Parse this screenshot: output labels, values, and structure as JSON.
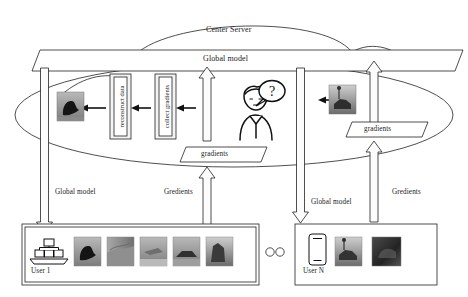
{
  "diagram": {
    "title_cloud": "Center Server",
    "global_model_banner": "Global model",
    "server_blocks": [
      {
        "label": "reconstruct data"
      },
      {
        "label": "collect gradients"
      }
    ],
    "attacker_icon": "person-with-question-icon",
    "gradient_tags": [
      {
        "label": "gradients"
      },
      {
        "label": "gradients"
      }
    ],
    "channel_labels": [
      {
        "label": "Global model"
      },
      {
        "label": "Gredients"
      },
      {
        "label": "Global model"
      },
      {
        "label": "Gredients"
      }
    ],
    "users": [
      {
        "name": "User 1",
        "device_icon": "server-rack-icon",
        "thumbnails": [
          "image-bird-dark",
          "image-landscape-gray",
          "image-plane-sky",
          "image-truck-road",
          "image-horse-field"
        ]
      },
      {
        "name": "User N",
        "device_icon": "smartphone-icon",
        "thumbnails": [
          "image-horse-rider",
          "image-dark-scene"
        ]
      }
    ],
    "ellipsis": "○○",
    "reconstructed_image": "image-bird-dark-reconstructed",
    "leaked_image": "image-horse-rider-leaked",
    "colors": {
      "stroke": "#222222",
      "fill": "#ffffff",
      "arrow_fill": "#fbfbfb",
      "box_fill": "#f2f2f2"
    }
  }
}
